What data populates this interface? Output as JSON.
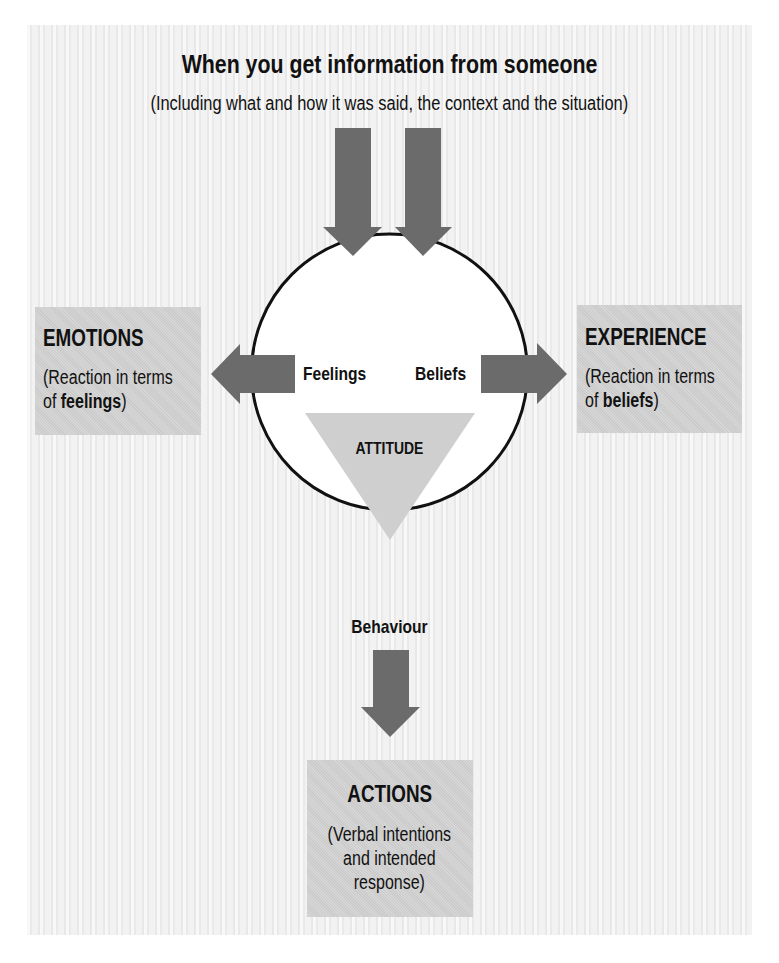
{
  "header": {
    "title": "When you get information from someone",
    "subtitle": "(Including what and how it was said, the context and the situation)"
  },
  "circle": {
    "left_label": "Feelings",
    "right_label": "Beliefs",
    "triangle_label": "ATTITUDE"
  },
  "emotions_box": {
    "heading": "EMOTIONS",
    "line1": "(Reaction in terms",
    "line2_prefix": "of ",
    "line2_bold": "feelings",
    "line2_suffix": ")"
  },
  "experience_box": {
    "heading": "EXPERIENCE",
    "line1": "(Reaction in terms",
    "line2_prefix": "of ",
    "line2_bold": "beliefs",
    "line2_suffix": ")"
  },
  "behaviour_label": "Behaviour",
  "actions_box": {
    "heading": "ACTIONS",
    "line1": "(Verbal intentions",
    "line2": "and intended",
    "line3": "response)"
  },
  "icons": {
    "input_arrows": [
      "arrow-down-icon",
      "arrow-down-icon"
    ],
    "emotions_arrow": "arrow-left-icon",
    "experience_arrow": "arrow-right-icon",
    "behaviour_arrow": "arrow-down-icon"
  },
  "colors": {
    "panel_background": "#efefef",
    "box_fill": "#d3d3d3",
    "arrow_fill": "#6b6b6b",
    "triangle_fill": "#cfcfcf",
    "circle_stroke": "#111111",
    "text": "#111111"
  }
}
